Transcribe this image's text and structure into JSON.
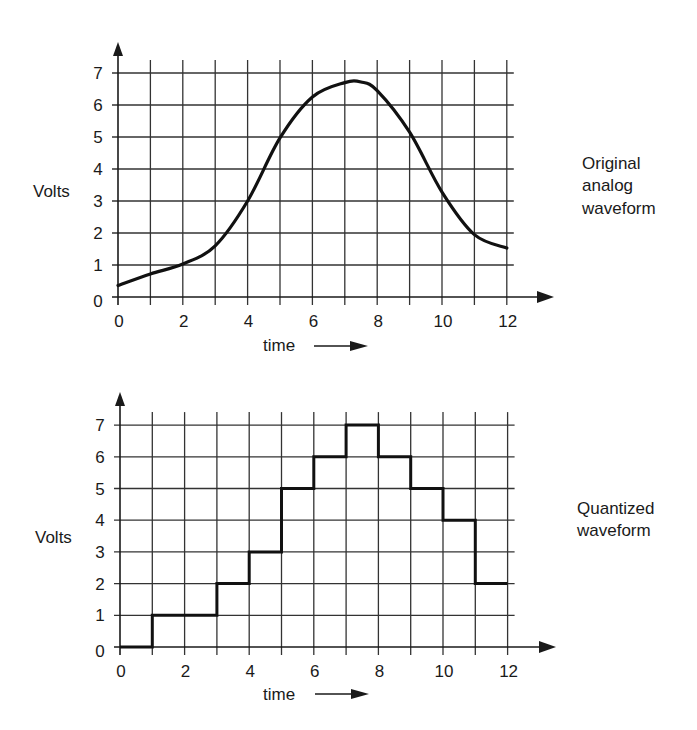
{
  "chart_data": [
    {
      "type": "line",
      "title": "Original analog waveform",
      "caption_lines": [
        "Original",
        "analog",
        "waveform"
      ],
      "xlabel": "time",
      "ylabel": "Volts",
      "x_ticks": [
        "0",
        "2",
        "4",
        "6",
        "8",
        "10",
        "12"
      ],
      "y_ticks": [
        "0",
        "1",
        "2",
        "3",
        "4",
        "5",
        "6",
        "7"
      ],
      "xlim": [
        0,
        12
      ],
      "ylim": [
        0,
        7
      ],
      "grid": true,
      "x": [
        0,
        1,
        2,
        3,
        4,
        5,
        6,
        7,
        7.5,
        8,
        9,
        10,
        11,
        12
      ],
      "values": [
        0.36,
        0.72,
        1.03,
        1.6,
        3.0,
        4.97,
        6.25,
        6.7,
        6.72,
        6.45,
        5.15,
        3.28,
        1.95,
        1.53
      ]
    },
    {
      "type": "line",
      "subtype": "step",
      "title": "Quantized waveform",
      "caption_lines": [
        "Quantized",
        "waveform"
      ],
      "xlabel": "time",
      "ylabel": "Volts",
      "x_ticks": [
        "0",
        "2",
        "4",
        "6",
        "8",
        "10",
        "12"
      ],
      "y_ticks": [
        "0",
        "1",
        "2",
        "3",
        "4",
        "5",
        "6",
        "7"
      ],
      "xlim": [
        0,
        12
      ],
      "ylim": [
        0,
        7
      ],
      "grid": true,
      "intervals": [
        [
          0,
          1
        ],
        [
          1,
          2
        ],
        [
          2,
          3
        ],
        [
          3,
          4
        ],
        [
          4,
          5
        ],
        [
          5,
          6
        ],
        [
          6,
          7
        ],
        [
          7,
          8
        ],
        [
          8,
          9
        ],
        [
          9,
          10
        ],
        [
          10,
          11
        ],
        [
          11,
          12
        ]
      ],
      "values": [
        0,
        1,
        1,
        2,
        3,
        5,
        6,
        7,
        6,
        5,
        4,
        2
      ]
    }
  ]
}
